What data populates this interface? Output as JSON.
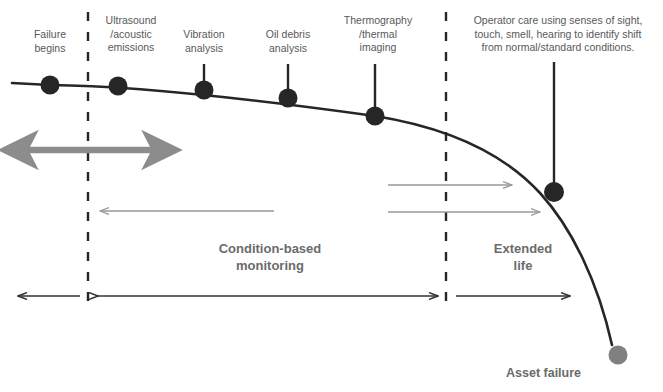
{
  "diagram": {
    "colors": {
      "curve": "#262626",
      "dot": "#262626",
      "dot_failure": "#808080",
      "dashed": "#262626",
      "grey_arrow": "#8c8c8c",
      "grey_arrow_thin": "#999999",
      "black_arrow": "#333333",
      "label_text": "#595959",
      "phase_text": "#6b6b6b"
    },
    "markers": [
      {
        "id": "failure-begins",
        "label": "Failure\nbegins",
        "label_x": 22,
        "label_y": 28,
        "label_w": 56,
        "dot_x": 50,
        "dot_y": 85,
        "dot_r": 9.5,
        "stem": false,
        "color": "#262626"
      },
      {
        "id": "ultrasound-acoustic-emissions",
        "label": "Ultrasound\n/acoustic\nemissions",
        "label_x": 95,
        "label_y": 14,
        "label_w": 72,
        "dot_x": 118,
        "dot_y": 86,
        "dot_r": 9.5,
        "stem": false,
        "color": "#262626"
      },
      {
        "id": "vibration-analysis",
        "label": "Vibration\nanalysis",
        "label_x": 172,
        "label_y": 28,
        "label_w": 64,
        "dot_x": 204,
        "dot_y": 90,
        "dot_r": 9.5,
        "stem": true,
        "stem_top": 64,
        "color": "#262626"
      },
      {
        "id": "oil-debris-analysis",
        "label": "Oil debris\nanalysis",
        "label_x": 254,
        "label_y": 28,
        "label_w": 68,
        "dot_x": 288,
        "dot_y": 98,
        "dot_r": 9.5,
        "stem": true,
        "stem_top": 64,
        "color": "#262626"
      },
      {
        "id": "thermography-thermal-imaging",
        "label": "Thermography\n/thermal\nimaging",
        "label_x": 335,
        "label_y": 14,
        "label_w": 86,
        "dot_x": 375,
        "dot_y": 116,
        "dot_r": 9.5,
        "stem": true,
        "stem_top": 64,
        "color": "#262626"
      },
      {
        "id": "operator-care",
        "label": "",
        "label_x": 0,
        "label_y": 0,
        "label_w": 0,
        "dot_x": 554,
        "dot_y": 192,
        "dot_r": 10,
        "stem": true,
        "stem_top": 62,
        "color": "#262626"
      }
    ],
    "operator_note": {
      "text": "Operator care using senses of sight,\ntouch, smell, hearing to identify shift\nfrom normal/standard conditions.",
      "x": 455,
      "y": 14,
      "w": 206
    },
    "failure_point": {
      "label": "Asset failure",
      "dot_x": 618,
      "dot_y": 355,
      "dot_r": 9.5,
      "label_x": 506,
      "label_y": 366,
      "color": "#808080"
    },
    "dividers": [
      {
        "id": "p-point-divider",
        "x": 88,
        "y1": 12,
        "y2": 302
      },
      {
        "id": "f-point-divider",
        "x": 446,
        "y1": 12,
        "y2": 302
      }
    ],
    "phases": [
      {
        "id": "condition-based-monitoring",
        "label": "Condition-based\nmonitoring",
        "x": 180,
        "y": 240,
        "w": 180
      },
      {
        "id": "extended-life",
        "label": "Extended\nlife",
        "x": 468,
        "y": 240,
        "w": 110
      }
    ],
    "arrows": [
      {
        "id": "detection-window-arrow",
        "style": "thick-grey-double",
        "x1": 18,
        "x2": 162,
        "y": 150,
        "color": "#8c8c8c"
      },
      {
        "id": "lead-time-arrow-left",
        "style": "thin-grey-left",
        "x1": 274,
        "x2": 100,
        "y": 211,
        "color": "#999999"
      },
      {
        "id": "operator-detection-arrow-upper",
        "style": "thin-grey-right",
        "x1": 388,
        "x2": 512,
        "y": 185,
        "color": "#999999"
      },
      {
        "id": "operator-detection-arrow-lower",
        "style": "thin-grey-right",
        "x1": 388,
        "x2": 540,
        "y": 212,
        "color": "#999999"
      },
      {
        "id": "monitoring-span-left-arrow",
        "style": "thin-black-left",
        "x1": 80,
        "x2": 18,
        "y": 296,
        "color": "#333333"
      },
      {
        "id": "monitoring-span-arrow",
        "style": "thin-black-double",
        "x1": 98,
        "x2": 438,
        "y": 296,
        "color": "#333333"
      },
      {
        "id": "extended-life-span-arrow",
        "style": "thin-black-right",
        "x1": 456,
        "x2": 570,
        "y": 296,
        "color": "#333333"
      }
    ],
    "curve": {
      "id": "pf-curve",
      "path": "M 12,83 L 50,85 C 140,86 260,100 375,116 C 450,128 505,155 540,193 C 572,228 598,282 612,345",
      "color": "#262626",
      "width": 2.6
    }
  }
}
